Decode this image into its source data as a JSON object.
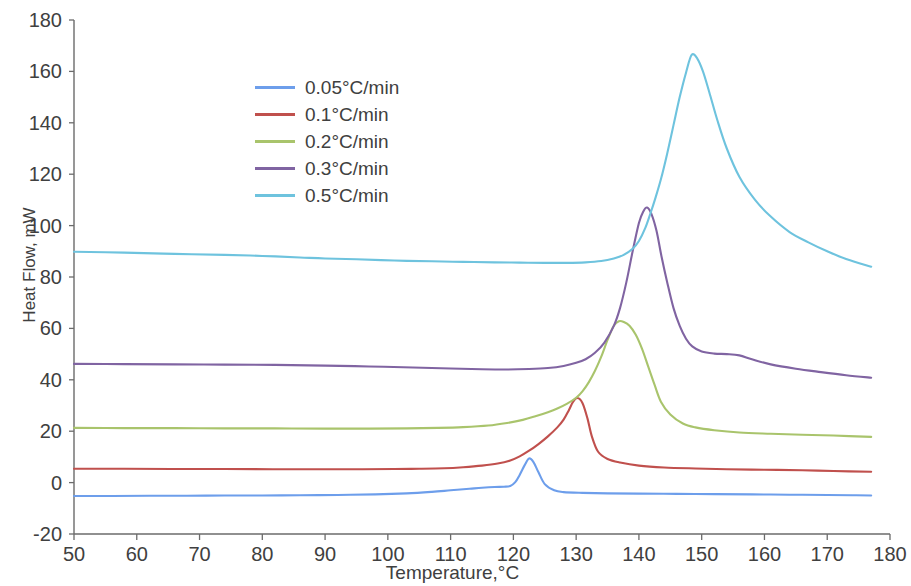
{
  "chart_data": {
    "type": "line",
    "title": "",
    "xlabel": "Temperature,°C",
    "ylabel": "Heat Flow, mW",
    "xlim": [
      50,
      180
    ],
    "ylim": [
      -20,
      180
    ],
    "xticks": [
      50,
      60,
      70,
      80,
      90,
      100,
      110,
      120,
      130,
      140,
      150,
      160,
      170,
      180
    ],
    "yticks": [
      -20,
      0,
      20,
      40,
      60,
      80,
      100,
      120,
      140,
      160,
      180
    ],
    "grid": false,
    "legend_position": "upper-left-inside",
    "series": [
      {
        "name": "0.05°C/min",
        "color": "#6D9EEB",
        "x": [
          50,
          56,
          62,
          68,
          74,
          80,
          86,
          92,
          98,
          103,
          107,
          110,
          113,
          115,
          117,
          118.5,
          119.5,
          120.3,
          121,
          121.8,
          122.5,
          123.2,
          124,
          125,
          126.5,
          128,
          131,
          135,
          140,
          146,
          152,
          158,
          164,
          170,
          174,
          177
        ],
        "y": [
          -5.2,
          -5.2,
          -5.1,
          -5.1,
          -5.0,
          -5.0,
          -4.9,
          -4.8,
          -4.6,
          -4.2,
          -3.6,
          -3.0,
          -2.4,
          -2.0,
          -1.7,
          -1.6,
          -1.3,
          0.2,
          3.0,
          6.8,
          9.4,
          8.0,
          4.0,
          -0.6,
          -3.0,
          -3.7,
          -4.0,
          -4.2,
          -4.3,
          -4.4,
          -4.5,
          -4.6,
          -4.7,
          -4.8,
          -4.9,
          -5.0
        ]
      },
      {
        "name": "0.1°C/min",
        "color": "#C0504D",
        "x": [
          50,
          58,
          66,
          74,
          82,
          90,
          96,
          101,
          105,
          109,
          112,
          115,
          117.5,
          119.5,
          121,
          122.5,
          124,
          125.5,
          127,
          128,
          128.8,
          129.5,
          130.2,
          131,
          131.8,
          132.5,
          133.5,
          135,
          137,
          140,
          144,
          149,
          154,
          160,
          166,
          171,
          177
        ],
        "y": [
          5.4,
          5.4,
          5.3,
          5.3,
          5.2,
          5.2,
          5.2,
          5.3,
          5.4,
          5.6,
          6.0,
          6.6,
          7.4,
          8.6,
          10.2,
          12.4,
          15.0,
          18.0,
          21.5,
          24.5,
          28.0,
          31.4,
          32.9,
          31.0,
          25.0,
          18.0,
          12.0,
          9.2,
          7.8,
          6.6,
          5.9,
          5.5,
          5.2,
          5.0,
          4.8,
          4.5,
          4.2
        ]
      },
      {
        "name": "0.2°C/min",
        "color": "#A9C46C",
        "x": [
          50,
          58,
          66,
          74,
          82,
          90,
          97,
          103,
          108,
          112,
          116,
          119,
          121.5,
          123.5,
          125.5,
          127,
          128.5,
          130,
          131,
          132,
          133,
          134,
          135,
          136,
          136.8,
          137.6,
          138.5,
          139.5,
          140.5,
          141.5,
          142.5,
          143.5,
          145,
          147,
          149,
          152,
          156,
          161,
          166,
          171,
          177
        ],
        "y": [
          21.3,
          21.2,
          21.2,
          21.1,
          21.1,
          21.0,
          21.0,
          21.1,
          21.3,
          21.6,
          22.2,
          23.2,
          24.4,
          25.8,
          27.4,
          28.8,
          30.6,
          33.0,
          35.5,
          39.0,
          43.5,
          49.0,
          55.5,
          61.0,
          62.8,
          62.5,
          61.0,
          57.5,
          52.0,
          45.0,
          38.0,
          31.5,
          26.5,
          23.0,
          21.5,
          20.4,
          19.5,
          19.0,
          18.6,
          18.3,
          17.8
        ]
      },
      {
        "name": "0.3°C/min",
        "color": "#8064A2",
        "x": [
          50,
          58,
          66,
          74,
          82,
          90,
          97,
          104,
          110,
          115,
          119,
          122.5,
          125.5,
          128,
          130,
          131.5,
          133,
          134.5,
          136,
          137,
          138,
          139,
          140,
          140.7,
          141.3,
          142,
          142.8,
          143.6,
          144.5,
          145.5,
          146.5,
          147.5,
          148.5,
          150,
          152,
          154,
          156,
          158,
          161,
          165,
          169,
          173,
          177
        ],
        "y": [
          46.2,
          46.1,
          46.0,
          45.9,
          45.8,
          45.5,
          45.2,
          44.8,
          44.4,
          44.1,
          44.0,
          44.2,
          44.6,
          45.4,
          46.6,
          48.0,
          50.5,
          54.5,
          61.0,
          68.0,
          78.0,
          90.0,
          101.0,
          105.5,
          107.0,
          104.5,
          98.0,
          88.0,
          78.0,
          68.0,
          61.0,
          56.0,
          53.0,
          51.0,
          50.2,
          50.0,
          49.5,
          48.0,
          46.0,
          44.3,
          43.0,
          41.8,
          40.8
        ]
      },
      {
        "name": "0.5°C/min",
        "color": "#6EC3DE",
        "x": [
          50,
          58,
          66,
          74,
          80,
          86,
          90,
          95,
          101,
          107,
          112,
          117,
          121,
          125,
          128.5,
          131.5,
          134,
          136,
          137.5,
          139,
          140,
          141,
          141.8,
          142.6,
          143.5,
          144.5,
          145.5,
          146.5,
          147.5,
          148.4,
          149.3,
          150.2,
          151.2,
          152.5,
          154,
          156,
          158.5,
          161,
          164,
          167,
          170,
          173,
          177
        ],
        "y": [
          89.8,
          89.5,
          89.0,
          88.6,
          88.2,
          87.6,
          87.2,
          86.9,
          86.4,
          86.1,
          85.9,
          85.7,
          85.6,
          85.5,
          85.5,
          85.7,
          86.2,
          87.2,
          88.5,
          91.0,
          94.0,
          99.0,
          104.5,
          110.5,
          118.0,
          128.0,
          139.0,
          150.0,
          159.5,
          166.4,
          165.0,
          160.0,
          152.0,
          141.0,
          130.0,
          119.0,
          110.0,
          103.5,
          97.5,
          93.5,
          90.0,
          87.0,
          84.0
        ]
      }
    ]
  },
  "axis": {
    "y_tick_labels": [
      "180",
      "160",
      "140",
      "120",
      "100",
      "80",
      "60",
      "40",
      "20",
      "0",
      "-20"
    ],
    "x_tick_labels": [
      "50",
      "60",
      "70",
      "80",
      "90",
      "100",
      "110",
      "120",
      "130",
      "140",
      "150",
      "160",
      "170",
      "180"
    ],
    "x_title": "Temperature,°C",
    "y_title": "Heat Flow, mW"
  },
  "legend": {
    "items": [
      {
        "label": "0.05°C/min",
        "color": "#6D9EEB"
      },
      {
        "label": "0.1°C/min",
        "color": "#C0504D"
      },
      {
        "label": "0.2°C/min",
        "color": "#A9C46C"
      },
      {
        "label": "0.3°C/min",
        "color": "#8064A2"
      },
      {
        "label": "0.5°C/min",
        "color": "#6EC3DE"
      }
    ]
  }
}
